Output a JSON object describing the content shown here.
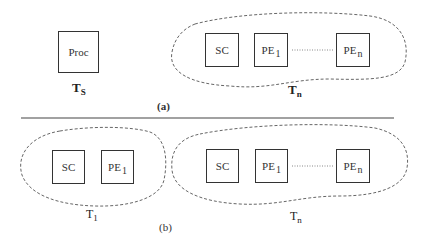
{
  "diagram": {
    "panel_a": {
      "caption": "(a)",
      "standalone": {
        "box_label": "Proc",
        "group_label": "T",
        "group_sub": "S"
      },
      "cluster": {
        "group_label": "T",
        "group_sub": "n",
        "boxes": [
          {
            "label": "SC",
            "sub": ""
          },
          {
            "label": "PE",
            "sub": "1"
          },
          {
            "label": "PE",
            "sub": "n"
          }
        ]
      }
    },
    "panel_b": {
      "caption": "(b)",
      "cluster_1": {
        "group_label": "T",
        "group_sub": "1",
        "boxes": [
          {
            "label": "SC",
            "sub": ""
          },
          {
            "label": "PE",
            "sub": "1"
          }
        ]
      },
      "cluster_n": {
        "group_label": "T",
        "group_sub": "n",
        "boxes": [
          {
            "label": "SC",
            "sub": ""
          },
          {
            "label": "PE",
            "sub": "1"
          },
          {
            "label": "PE",
            "sub": "n"
          }
        ]
      }
    },
    "colors": {
      "stroke": "#333333",
      "dashed": "#666666",
      "background": "#ffffff"
    }
  }
}
